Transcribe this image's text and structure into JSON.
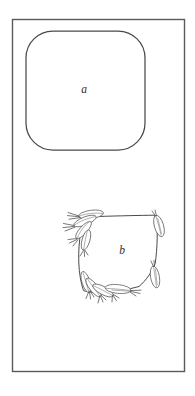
{
  "figure": {
    "type": "line-diagram",
    "background_color": "#ffffff",
    "ink_color": "#4a4a4a",
    "frame": {
      "name": "outer-frame",
      "x": 12,
      "y": 19,
      "width": 173,
      "height": 353,
      "stroke": "#5a5a5a",
      "fill": "#ffffff"
    },
    "panels": [
      {
        "id": "a",
        "label": "a",
        "shape": "rounded-square",
        "description": "plain rounded square outline, smooth continuous contour",
        "x": 26,
        "y": 31,
        "width": 119,
        "height": 119,
        "corner_radius": 27
      },
      {
        "id": "b",
        "label": "b",
        "shape": "square-loop-with-spikes",
        "description": "square loop contour decorated with elongated pointed ellipses (grain spikes) clustered at upper-left and lower-left corners and single spikes at the right corners",
        "x": 77,
        "y": 214,
        "width": 80,
        "height": 80,
        "spike_clusters": 2,
        "single_spikes": 2
      }
    ],
    "labels": [
      {
        "name": "panel-label-a",
        "text": "a",
        "x": 84,
        "y": 93
      },
      {
        "name": "panel-label-b",
        "text": "b",
        "x": 122,
        "y": 254
      }
    ]
  }
}
